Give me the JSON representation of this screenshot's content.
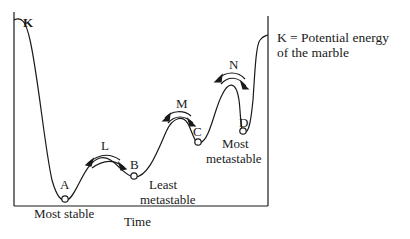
{
  "diagram": {
    "x_axis_label": "Time",
    "curve_label": "K",
    "legend": {
      "line1": "K = Potential energy",
      "line2": "of the marble"
    },
    "points": [
      {
        "id": "A",
        "label": "A",
        "caption": "Most stable"
      },
      {
        "id": "B",
        "label": "B",
        "caption_line1": "Least",
        "caption_line2": "metastable"
      },
      {
        "id": "C",
        "label": "C"
      },
      {
        "id": "D",
        "label": "D",
        "caption_line1": "Most",
        "caption_line2": "metastable"
      }
    ],
    "transitions": [
      {
        "id": "L",
        "label": "L"
      },
      {
        "id": "M",
        "label": "M"
      },
      {
        "id": "N",
        "label": "N"
      }
    ],
    "colors": {
      "ink": "#1a1a1a",
      "background": "#ffffff"
    }
  }
}
